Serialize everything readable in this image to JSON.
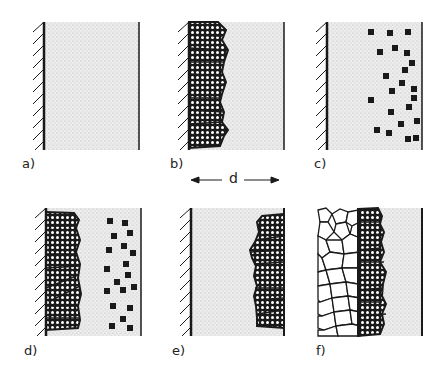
{
  "figure": {
    "panels": [
      {
        "id": "a",
        "label": "a)",
        "description": "empty cavity with mold wall (hatched) on left"
      },
      {
        "id": "b",
        "label": "b)",
        "description": "columnar crystals growing from mold wall"
      },
      {
        "id": "c",
        "label": "c)",
        "description": "equiaxed nuclei scattered near right side"
      },
      {
        "id": "d",
        "label": "d)",
        "description": "columnar zone plus scattered nuclei"
      },
      {
        "id": "e",
        "label": "e)",
        "description": "columnar crystals on right wall"
      },
      {
        "id": "f",
        "label": "f)",
        "description": "equiaxed grains, columnar zone, liquid"
      }
    ],
    "dimension_label": "d",
    "colors": {
      "ink": "#1a1a1a",
      "melt": "#e4e4e4",
      "background": "#ffffff"
    }
  }
}
